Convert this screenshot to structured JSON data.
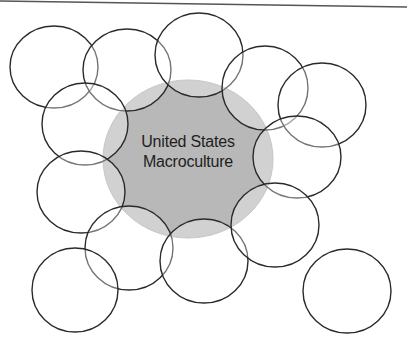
{
  "diagram": {
    "type": "overlapping-circles",
    "center": {
      "label_line1": "United States",
      "label_line2": "Macroculture",
      "cx": 188,
      "cy": 159,
      "rx": 85,
      "ry": 79,
      "fill": "#b8b8b8",
      "stroke": "#a8a8a8"
    },
    "subcultures": [
      {
        "id": "circle-1",
        "cx": 54,
        "cy": 67,
        "rx": 44,
        "ry": 41
      },
      {
        "id": "circle-2",
        "cx": 127,
        "cy": 70,
        "rx": 44,
        "ry": 41
      },
      {
        "id": "circle-3",
        "cx": 199,
        "cy": 55,
        "rx": 44,
        "ry": 42
      },
      {
        "id": "circle-4",
        "cx": 265,
        "cy": 88,
        "rx": 43,
        "ry": 42
      },
      {
        "id": "circle-5",
        "cx": 322,
        "cy": 105,
        "rx": 44,
        "ry": 42
      },
      {
        "id": "circle-6",
        "cx": 297,
        "cy": 157,
        "rx": 44,
        "ry": 41
      },
      {
        "id": "circle-7",
        "cx": 85,
        "cy": 124,
        "rx": 43,
        "ry": 41
      },
      {
        "id": "circle-8",
        "cx": 81,
        "cy": 192,
        "rx": 44,
        "ry": 41
      },
      {
        "id": "circle-9",
        "cx": 129,
        "cy": 248,
        "rx": 44,
        "ry": 42
      },
      {
        "id": "circle-10",
        "cx": 204,
        "cy": 261,
        "rx": 44,
        "ry": 42
      },
      {
        "id": "circle-11",
        "cx": 275,
        "cy": 225,
        "rx": 44,
        "ry": 42
      },
      {
        "id": "circle-12",
        "cx": 75,
        "cy": 290,
        "rx": 43,
        "ry": 42
      },
      {
        "id": "circle-13",
        "cx": 347,
        "cy": 291,
        "rx": 44,
        "ry": 42
      }
    ],
    "colors": {
      "outline": "#2a2a2a",
      "overlap_fill": "rgba(255,255,255,0.35)",
      "top_rule": "#555555"
    }
  }
}
